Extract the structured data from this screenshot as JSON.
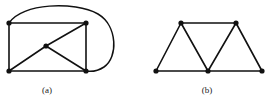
{
  "figure": {
    "width": 273,
    "height": 103,
    "background": "#ffffff",
    "ink_color": "#111111",
    "caption_color": "#1a1a1a"
  },
  "panels": [
    {
      "id": "a",
      "caption": "(a)",
      "caption_x": 47,
      "caption_y": 90,
      "description": "Graph with five vertices: a rectangle whose four corners plus one central vertex; the central vertex joins the top-right, bottom-left and bottom-right corners, and a large curved arc joins the top-left corner to the bottom-right corner around the outside.",
      "vertices": [
        {
          "name": "top-left",
          "x": 9,
          "y": 23
        },
        {
          "name": "top-right",
          "x": 86,
          "y": 23
        },
        {
          "name": "bottom-left",
          "x": 9,
          "y": 71
        },
        {
          "name": "bottom-right",
          "x": 86,
          "y": 71
        },
        {
          "name": "center",
          "x": 46,
          "y": 46
        }
      ],
      "straight_edges": [
        {
          "from": "top-left",
          "to": "top-right"
        },
        {
          "from": "top-left",
          "to": "bottom-left"
        },
        {
          "from": "top-right",
          "to": "bottom-right"
        },
        {
          "from": "bottom-left",
          "to": "bottom-right"
        },
        {
          "from": "center",
          "to": "top-right"
        },
        {
          "from": "center",
          "to": "bottom-left"
        },
        {
          "from": "center",
          "to": "bottom-right"
        }
      ],
      "curved_edges": [
        {
          "from": "top-left",
          "to": "bottom-right",
          "path": "M 9 23 C 22 3 74 1 98 14 C 118 26 118 58 104 67 C 98 71 92 72 86 71"
        }
      ],
      "vertex_count": 5,
      "edge_count": 8
    },
    {
      "id": "b",
      "caption": "(b)",
      "caption_x": 207,
      "caption_y": 90,
      "description": "Graph with five vertices forming three triangles in a strip: two upper vertices joined by a horizontal edge, three lower vertices joined by a horizontal edge, with zig-zag edges forming triangles.",
      "vertices": [
        {
          "name": "top-left",
          "x": 181,
          "y": 23
        },
        {
          "name": "top-right",
          "x": 236,
          "y": 23
        },
        {
          "name": "bottom-left",
          "x": 156,
          "y": 71
        },
        {
          "name": "bottom-middle",
          "x": 208,
          "y": 71
        },
        {
          "name": "bottom-right",
          "x": 262,
          "y": 71
        }
      ],
      "straight_edges": [
        {
          "from": "top-left",
          "to": "top-right"
        },
        {
          "from": "bottom-left",
          "to": "bottom-middle"
        },
        {
          "from": "bottom-middle",
          "to": "bottom-right"
        },
        {
          "from": "top-left",
          "to": "bottom-left"
        },
        {
          "from": "top-left",
          "to": "bottom-middle"
        },
        {
          "from": "top-right",
          "to": "bottom-middle"
        },
        {
          "from": "top-right",
          "to": "bottom-right"
        }
      ],
      "curved_edges": [],
      "vertex_count": 5,
      "edge_count": 7
    }
  ]
}
